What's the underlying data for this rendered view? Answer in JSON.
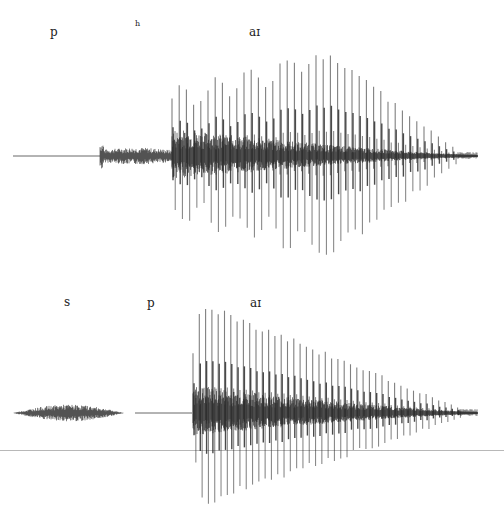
{
  "figure": {
    "colors": {
      "waveform": "#2a2a2a",
      "background": "#ffffff",
      "rule": "#b8b8b8"
    }
  },
  "panels": [
    {
      "id": "pie",
      "labels": [
        {
          "text": "p",
          "x": 50,
          "y": 26,
          "size": 12
        },
        {
          "text": "h",
          "x": 135,
          "y": 20,
          "size": 8
        },
        {
          "text": "aɪ",
          "x": 249,
          "y": 26,
          "size": 12
        }
      ],
      "baseline_y": 156,
      "segments": [
        {
          "type": "silence",
          "x0": 13,
          "x1": 100,
          "amp": 0.6
        },
        {
          "type": "aspiration",
          "x0": 100,
          "x1": 172,
          "amp": 7
        },
        {
          "type": "vowel",
          "x0": 172,
          "x1": 478,
          "peak_up": 106,
          "peak_down": 100,
          "period": 7.2,
          "decay_start": 330
        }
      ]
    },
    {
      "id": "spy",
      "labels": [
        {
          "text": "s",
          "x": 64,
          "y": 296,
          "size": 12
        },
        {
          "text": "p",
          "x": 147,
          "y": 297,
          "size": 12
        },
        {
          "text": "aɪ",
          "x": 250,
          "y": 297,
          "size": 12
        }
      ],
      "baseline_y": 413,
      "segments": [
        {
          "type": "fricative",
          "x0": 13,
          "x1": 135,
          "amp": 7
        },
        {
          "type": "closure",
          "x0": 135,
          "x1": 192,
          "amp": 0.6
        },
        {
          "type": "vowel",
          "x0": 193,
          "x1": 478,
          "peak_up": 113,
          "peak_down": 95,
          "period": 6.3,
          "decay_start": 205
        }
      ],
      "rule_y": 450
    }
  ]
}
